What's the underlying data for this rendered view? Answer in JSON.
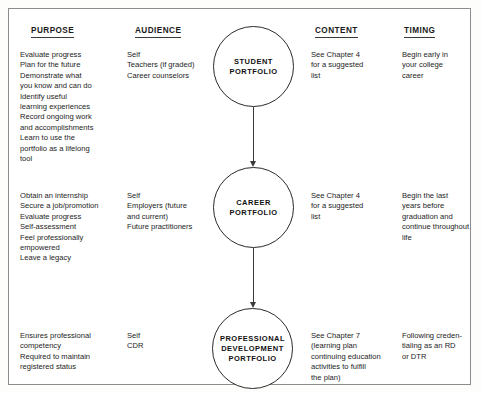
{
  "diagram": {
    "frame_border_color": "#8c8c8c",
    "columns": [
      {
        "key": "purpose",
        "label": "PURPOSE"
      },
      {
        "key": "audience",
        "label": "AUDIENCE"
      },
      {
        "key": "content",
        "label": "CONTENT"
      },
      {
        "key": "timing",
        "label": "TIMING"
      }
    ],
    "nodes": [
      {
        "id": "student",
        "label": "STUDENT\nPORTFOLIO"
      },
      {
        "id": "career",
        "label": "CAREER\nPORTFOLIO"
      },
      {
        "id": "professional",
        "label": "PROFESSIONAL\nDEVELOPMENT\nPORTFOLIO"
      }
    ],
    "connectors": [
      {
        "from": "student",
        "to": "career",
        "style": "arrow-down"
      },
      {
        "from": "career",
        "to": "professional",
        "style": "arrow-down"
      }
    ],
    "rows": [
      {
        "node": "STUDENT PORTFOLIO",
        "purpose": "Evaluate progress\nPlan for the future\nDemonstrate what\n  you know and can do\nIdentify useful\n  learning experiences\nRecord ongoing work\n  and accomplishments\nLearn to use the\n  portfolio as a lifelong\n  tool",
        "audience": "Self\nTeachers (if graded)\nCareer counselors",
        "content": "See Chapter 4\n  for a suggested\n  list",
        "timing": "Begin early in\n  your college\n  career"
      },
      {
        "node": "CAREER PORTFOLIO",
        "purpose": "Obtain an internship\nSecure a job/promotion\nEvaluate progress\nSelf-assessment\nFeel professionally\n  empowered\nLeave a legacy",
        "audience": "Self\nEmployers (future\n  and current)\nFuture practitioners",
        "content": "See Chapter 4\n  for a suggested\n  list",
        "timing": "Begin the last\n  years before\n  graduation and\n  continue throughout\n  life"
      },
      {
        "node": "PROFESSIONAL DEVELOPMENT PORTFOLIO",
        "purpose": "Ensures professional\n  competency\nRequired to maintain\n  registered status",
        "audience": "Self\nCDR",
        "content": "See Chapter 7\n  (learning plan\n  continuing education\n  activities to fulfill\n  the plan)",
        "timing": "Following creden-\n  tialing as an RD\n  or DTR"
      }
    ]
  }
}
